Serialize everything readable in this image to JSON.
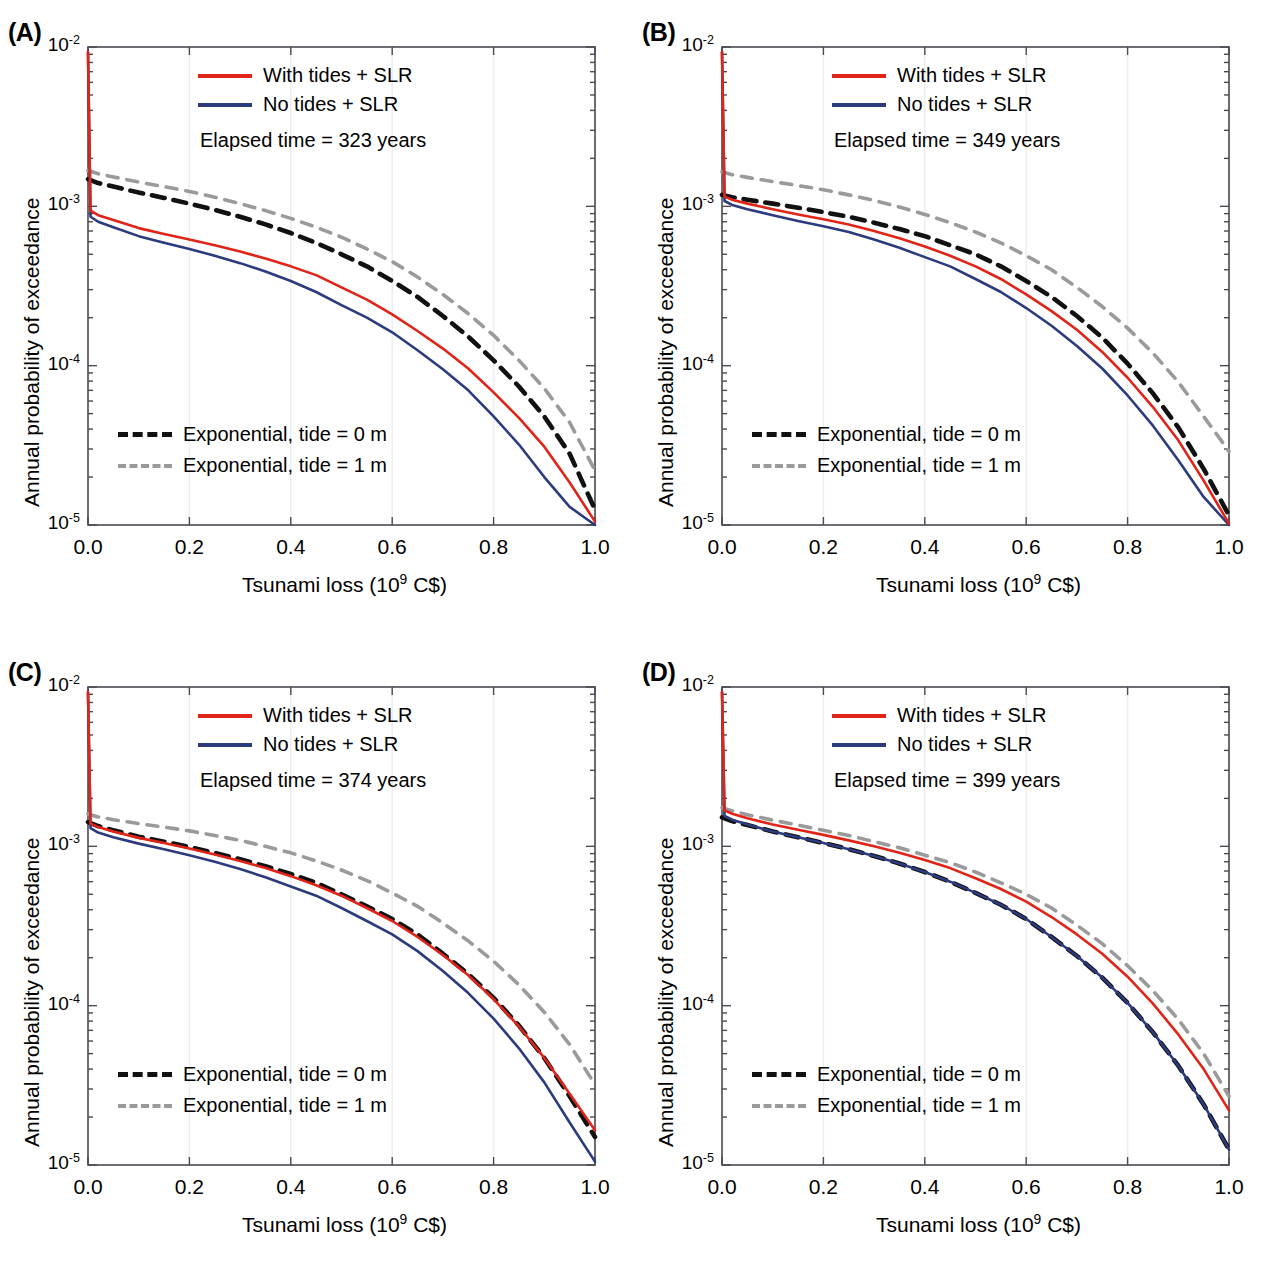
{
  "figure": {
    "panels": [
      {
        "key": "A",
        "label": "(A)",
        "elapsed_time": "Elapsed time = 323 years",
        "legend_top": [
          {
            "name": "with-tides-slr",
            "label": "With tides + SLR",
            "style": "solid-red"
          },
          {
            "name": "no-tides-slr",
            "label": "No tides + SLR",
            "style": "solid-blue"
          }
        ],
        "legend_bottom": [
          {
            "name": "exponential-tide-0m",
            "label": "Exponential, tide = 0 m",
            "style": "dashed-black"
          },
          {
            "name": "exponential-tide-1m",
            "label": "Exponential, tide = 1 m",
            "style": "dashed-gray"
          }
        ]
      },
      {
        "key": "B",
        "label": "(B)",
        "elapsed_time": "Elapsed time = 349 years",
        "legend_top": [
          {
            "name": "with-tides-slr",
            "label": "With tides + SLR",
            "style": "solid-red"
          },
          {
            "name": "no-tides-slr",
            "label": "No tides + SLR",
            "style": "solid-blue"
          }
        ],
        "legend_bottom": [
          {
            "name": "exponential-tide-0m",
            "label": "Exponential, tide = 0 m",
            "style": "dashed-black"
          },
          {
            "name": "exponential-tide-1m",
            "label": "Exponential, tide = 1 m",
            "style": "dashed-gray"
          }
        ]
      },
      {
        "key": "C",
        "label": "(C)",
        "elapsed_time": "Elapsed time = 374 years",
        "legend_top": [
          {
            "name": "with-tides-slr",
            "label": "With tides + SLR",
            "style": "solid-red"
          },
          {
            "name": "no-tides-slr",
            "label": "No tides + SLR",
            "style": "solid-blue"
          }
        ],
        "legend_bottom": [
          {
            "name": "exponential-tide-0m",
            "label": "Exponential, tide = 0 m",
            "style": "dashed-black"
          },
          {
            "name": "exponential-tide-1m",
            "label": "Exponential, tide = 1 m",
            "style": "dashed-gray"
          }
        ]
      },
      {
        "key": "D",
        "label": "(D)",
        "elapsed_time": "Elapsed time = 399 years",
        "legend_top": [
          {
            "name": "with-tides-slr",
            "label": "With tides + SLR",
            "style": "solid-red"
          },
          {
            "name": "no-tides-slr",
            "label": "No tides + SLR",
            "style": "solid-blue"
          }
        ],
        "legend_bottom": [
          {
            "name": "exponential-tide-0m",
            "label": "Exponential, tide = 0 m",
            "style": "dashed-black"
          },
          {
            "name": "exponential-tide-1m",
            "label": "Exponential, tide = 1 m",
            "style": "dashed-gray"
          }
        ]
      }
    ],
    "colors": {
      "with_tides_slr": "#e02418",
      "no_tides_slr": "#2c3a7e",
      "exponential_tide_0m": "#111111",
      "exponential_tide_1m": "#9a9a9a",
      "axis": "#4a4a52",
      "gridline": "#eeeef2",
      "background": "#ffffff"
    }
  },
  "axes": {
    "xlabel_html": "Tsunami loss (10<sup>9</sup> C$)",
    "ylabel": "Annual probability of exceedance",
    "xticks": [
      "0.0",
      "0.2",
      "0.4",
      "0.6",
      "0.8",
      "1.0"
    ],
    "xtick_values": [
      0.0,
      0.2,
      0.4,
      0.6,
      0.8,
      1.0
    ],
    "yticks_html": [
      "10<sup>-2</sup>",
      "10<sup>-3</sup>",
      "10<sup>-4</sup>",
      "10<sup>-5</sup>"
    ],
    "ytick_values": [
      0.01,
      0.001,
      0.0001,
      1e-05
    ],
    "xlim": [
      0.0,
      1.0
    ],
    "ylim": [
      1e-05,
      0.01
    ],
    "yscale": "log",
    "grid": "faint vertical gridlines at x ticks"
  },
  "chart_data": {
    "type": "line",
    "title": "",
    "xlabel": "Tsunami loss (10^9 C$)",
    "ylabel": "Annual probability of exceedance",
    "yscale": "log",
    "xlim": [
      0.0,
      1.0
    ],
    "ylim": [
      1e-05,
      0.01
    ],
    "x": [
      0.0,
      0.005,
      0.02,
      0.05,
      0.1,
      0.15,
      0.2,
      0.25,
      0.3,
      0.35,
      0.4,
      0.45,
      0.5,
      0.55,
      0.6,
      0.65,
      0.7,
      0.75,
      0.8,
      0.85,
      0.9,
      0.95,
      1.0
    ],
    "panels": [
      {
        "key": "A",
        "elapsed_time_years": 323,
        "series": [
          {
            "name": "With tides + SLR",
            "color": "#e02418",
            "style": "solid",
            "values": [
              0.0093,
              0.00094,
              0.00088,
              0.00082,
              0.00073,
              0.00067,
              0.00062,
              0.00057,
              0.00052,
              0.00047,
              0.00042,
              0.00037,
              0.00031,
              0.00026,
              0.00021,
              0.000165,
              0.000128,
              9.6e-05,
              6.8e-05,
              4.7e-05,
              3.1e-05,
              1.85e-05,
              1.05e-05
            ]
          },
          {
            "name": "No tides + SLR",
            "color": "#2c3a7e",
            "style": "solid",
            "values": [
              0.0093,
              0.00086,
              0.0008,
              0.00074,
              0.00065,
              0.00059,
              0.00054,
              0.00049,
              0.00044,
              0.00039,
              0.00034,
              0.00029,
              0.00024,
              0.0002,
              0.000162,
              0.000125,
              9.5e-05,
              7e-05,
              4.8e-05,
              3.2e-05,
              2e-05,
              1.3e-05,
              1e-05
            ]
          },
          {
            "name": "Exponential, tide = 0 m",
            "color": "#111111",
            "style": "dashed",
            "values": [
              0.00148,
              0.00146,
              0.0014,
              0.00133,
              0.00122,
              0.00113,
              0.00104,
              0.00095,
              0.00086,
              0.00077,
              0.00068,
              0.00059,
              0.0005,
              0.00042,
              0.00034,
              0.00027,
              0.000205,
              0.000152,
              0.000108,
              7.4e-05,
              4.8e-05,
              2.8e-05,
              1.25e-05
            ]
          },
          {
            "name": "Exponential, tide = 1 m",
            "color": "#9a9a9a",
            "style": "dashed",
            "values": [
              0.00168,
              0.00166,
              0.0016,
              0.00153,
              0.00142,
              0.00133,
              0.00124,
              0.00114,
              0.00104,
              0.00094,
              0.00084,
              0.00074,
              0.00064,
              0.00054,
              0.00045,
              0.00036,
              0.00028,
              0.000212,
              0.000155,
              0.000108,
              7.2e-05,
              4.4e-05,
              2.2e-05
            ]
          }
        ]
      },
      {
        "key": "B",
        "elapsed_time_years": 349,
        "series": [
          {
            "name": "With tides + SLR",
            "color": "#e02418",
            "style": "solid",
            "values": [
              0.0093,
              0.00115,
              0.0011,
              0.00104,
              0.00096,
              0.00089,
              0.00083,
              0.00077,
              0.0007,
              0.00063,
              0.00056,
              0.00049,
              0.00042,
              0.00035,
              0.00028,
              0.00022,
              0.000168,
              0.000122,
              8.4e-05,
              5.5e-05,
              3.4e-05,
              1.9e-05,
              1.02e-05
            ]
          },
          {
            "name": "No tides + SLR",
            "color": "#2c3a7e",
            "style": "solid",
            "values": [
              0.0093,
              0.00108,
              0.00102,
              0.00096,
              0.00088,
              0.00081,
              0.00075,
              0.00069,
              0.00062,
              0.00055,
              0.00048,
              0.00042,
              0.00035,
              0.00029,
              0.00023,
              0.000178,
              0.000133,
              9.6e-05,
              6.5e-05,
              4.2e-05,
              2.55e-05,
              1.5e-05,
              1e-05
            ]
          },
          {
            "name": "Exponential, tide = 0 m",
            "color": "#111111",
            "style": "dashed",
            "values": [
              0.00118,
              0.00117,
              0.00114,
              0.0011,
              0.00104,
              0.00098,
              0.00092,
              0.00086,
              0.00079,
              0.00072,
              0.00065,
              0.00057,
              0.0005,
              0.00042,
              0.00034,
              0.00027,
              0.000205,
              0.00015,
              0.000103,
              6.7e-05,
              4.1e-05,
              2.25e-05,
              1.15e-05
            ]
          },
          {
            "name": "Exponential, tide = 1 m",
            "color": "#9a9a9a",
            "style": "dashed",
            "values": [
              0.00165,
              0.00163,
              0.00158,
              0.00152,
              0.00143,
              0.00135,
              0.00127,
              0.00118,
              0.00109,
              0.00099,
              0.00089,
              0.00079,
              0.00069,
              0.00059,
              0.00049,
              0.0004,
              0.00031,
              0.000235,
              0.000172,
              0.00012,
              7.9e-05,
              4.8e-05,
              2.9e-05
            ]
          }
        ]
      },
      {
        "key": "C",
        "elapsed_time_years": 374,
        "series": [
          {
            "name": "With tides + SLR",
            "color": "#e02418",
            "style": "solid",
            "values": [
              0.0093,
              0.00139,
              0.00132,
              0.00124,
              0.00113,
              0.00105,
              0.00097,
              0.00089,
              0.00081,
              0.00073,
              0.00065,
              0.00057,
              0.00049,
              0.00041,
              0.00034,
              0.00027,
              0.000208,
              0.000155,
              0.00011,
              7.4e-05,
              4.7e-05,
              2.8e-05,
              1.65e-05
            ]
          },
          {
            "name": "No tides + SLR",
            "color": "#2c3a7e",
            "style": "solid",
            "values": [
              0.0093,
              0.0013,
              0.00122,
              0.00114,
              0.00104,
              0.00096,
              0.00088,
              0.0008,
              0.00072,
              0.00064,
              0.00056,
              0.00049,
              0.00041,
              0.00034,
              0.00028,
              0.00022,
              0.000165,
              0.00012,
              8.3e-05,
              5.4e-05,
              3.3e-05,
              1.85e-05,
              1.05e-05
            ]
          },
          {
            "name": "Exponential, tide = 0 m",
            "color": "#111111",
            "style": "dashed",
            "values": [
              0.00142,
              0.0014,
              0.00134,
              0.00126,
              0.00115,
              0.00107,
              0.00099,
              0.00091,
              0.00083,
              0.00075,
              0.00067,
              0.00059,
              0.0005,
              0.00042,
              0.00035,
              0.00028,
              0.000212,
              0.000158,
              0.000112,
              7.5e-05,
              4.7e-05,
              2.7e-05,
              1.5e-05
            ]
          },
          {
            "name": "Exponential, tide = 1 m",
            "color": "#9a9a9a",
            "style": "dashed",
            "values": [
              0.0016,
              0.00158,
              0.00153,
              0.00147,
              0.00139,
              0.00132,
              0.00125,
              0.00117,
              0.00109,
              0.001,
              0.00091,
              0.00081,
              0.00071,
              0.00061,
              0.00051,
              0.00042,
              0.00033,
              0.000255,
              0.00019,
              0.000135,
              9.1e-05,
              5.7e-05,
              3.2e-05
            ]
          }
        ]
      },
      {
        "key": "D",
        "elapsed_time_years": 399,
        "series": [
          {
            "name": "With tides + SLR",
            "color": "#e02418",
            "style": "solid",
            "values": [
              0.0093,
              0.00168,
              0.0016,
              0.0015,
              0.00137,
              0.00127,
              0.00118,
              0.00109,
              0.001,
              0.00091,
              0.00082,
              0.00073,
              0.00063,
              0.00054,
              0.00045,
              0.00036,
              0.00028,
              0.000212,
              0.000152,
              0.000103,
              6.6e-05,
              4e-05,
              2.2e-05
            ]
          },
          {
            "name": "No tides + SLR",
            "color": "#2c3a7e",
            "style": "solid",
            "values": [
              0.0093,
              0.00155,
              0.00147,
              0.00137,
              0.00124,
              0.00114,
              0.00105,
              0.00096,
              0.00087,
              0.00078,
              0.00069,
              0.0006,
              0.00051,
              0.00043,
              0.00035,
              0.00027,
              0.000205,
              0.00015,
              0.000104,
              6.8e-05,
              4.2e-05,
              2.4e-05,
              1.25e-05
            ]
          },
          {
            "name": "Exponential, tide = 0 m",
            "color": "#111111",
            "style": "dashed",
            "values": [
              0.00152,
              0.0015,
              0.00144,
              0.00136,
              0.00124,
              0.00114,
              0.00105,
              0.00096,
              0.00087,
              0.00078,
              0.00069,
              0.0006,
              0.00051,
              0.00043,
              0.00035,
              0.00027,
              0.000205,
              0.00015,
              0.000104,
              6.8e-05,
              4.2e-05,
              2.4e-05,
              1.25e-05
            ]
          },
          {
            "name": "Exponential, tide = 1 m",
            "color": "#9a9a9a",
            "style": "dashed",
            "values": [
              0.00175,
              0.00173,
              0.00167,
              0.00158,
              0.00146,
              0.00136,
              0.00126,
              0.00117,
              0.00107,
              0.00098,
              0.00088,
              0.00079,
              0.00069,
              0.00059,
              0.0005,
              0.00041,
              0.00032,
              0.000245,
              0.000178,
              0.000124,
              8.2e-05,
              5e-05,
              2.7e-05
            ]
          }
        ]
      }
    ]
  }
}
